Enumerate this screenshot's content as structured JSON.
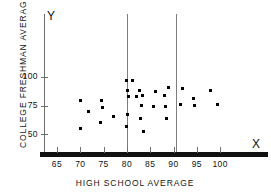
{
  "chart_data": {
    "type": "scatter",
    "title": "",
    "xlabel": "HIGH SCHOOL AVERAGE",
    "ylabel": "COLLEGE FRESHMAN AVERAGE",
    "x_axis_letter": "X",
    "y_axis_letter": "Y",
    "xlim": [
      61,
      110
    ],
    "ylim": [
      42,
      120
    ],
    "xticks": [
      65,
      70,
      75,
      80,
      85,
      90,
      95,
      100
    ],
    "yticks": [
      50,
      75,
      100
    ],
    "grid": false,
    "legend": null,
    "reference_lines": [
      {
        "orientation": "vertical",
        "x": 80
      },
      {
        "orientation": "vertical",
        "x": 90.5
      }
    ],
    "points": [
      {
        "x": 70.0,
        "y": 79
      },
      {
        "x": 70.0,
        "y": 55
      },
      {
        "x": 71.8,
        "y": 70
      },
      {
        "x": 74.6,
        "y": 79
      },
      {
        "x": 74.8,
        "y": 73
      },
      {
        "x": 74.4,
        "y": 60
      },
      {
        "x": 77.1,
        "y": 65
      },
      {
        "x": 79.9,
        "y": 97
      },
      {
        "x": 81.2,
        "y": 97
      },
      {
        "x": 80.2,
        "y": 88
      },
      {
        "x": 82.7,
        "y": 88
      },
      {
        "x": 80.3,
        "y": 83
      },
      {
        "x": 82.1,
        "y": 83
      },
      {
        "x": 80.2,
        "y": 67
      },
      {
        "x": 79.9,
        "y": 57
      },
      {
        "x": 83.3,
        "y": 84
      },
      {
        "x": 83.2,
        "y": 75
      },
      {
        "x": 83.0,
        "y": 64
      },
      {
        "x": 83.5,
        "y": 52
      },
      {
        "x": 86.1,
        "y": 87
      },
      {
        "x": 85.8,
        "y": 74
      },
      {
        "x": 88.0,
        "y": 84
      },
      {
        "x": 88.9,
        "y": 91
      },
      {
        "x": 88.2,
        "y": 74
      },
      {
        "x": 88.4,
        "y": 64
      },
      {
        "x": 91.5,
        "y": 76
      },
      {
        "x": 92.0,
        "y": 90
      },
      {
        "x": 94.2,
        "y": 81
      },
      {
        "x": 94.6,
        "y": 75
      },
      {
        "x": 97.9,
        "y": 88
      },
      {
        "x": 99.4,
        "y": 76
      }
    ]
  }
}
